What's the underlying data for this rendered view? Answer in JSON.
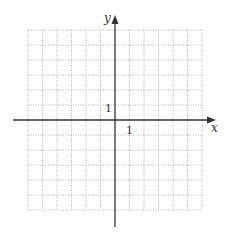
{
  "diagram": {
    "type": "coordinate-grid",
    "x_axis_label": "x",
    "y_axis_label": "y",
    "x_tick_label": "1",
    "y_tick_label": "1",
    "x_range": [
      -6,
      6
    ],
    "y_range": [
      -6,
      6
    ],
    "grid_style": "dotted",
    "colors": {
      "axis": "#333333",
      "grid": "#b0b0b0",
      "background": "#ffffff"
    }
  }
}
